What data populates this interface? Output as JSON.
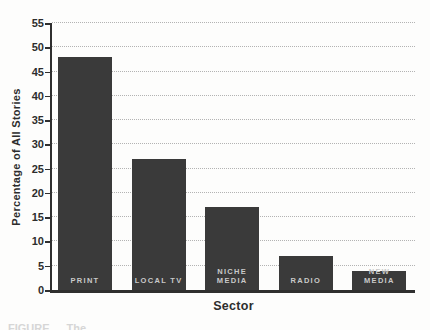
{
  "figure": {
    "caption_fragment": "FIGURE    The"
  },
  "chart_data": {
    "type": "bar",
    "title": "",
    "xlabel": "Sector",
    "ylabel": "Percentage of All Stories",
    "ylim": [
      0,
      55
    ],
    "ytick_step": 5,
    "yticks": [
      "0",
      "5",
      "10",
      "15",
      "20",
      "25",
      "30",
      "35",
      "40",
      "45",
      "50",
      "55"
    ],
    "grid": "horizontal-dotted",
    "legend_position": "none",
    "categories": [
      "PRINT",
      "LOCAL TV",
      "NICHE MEDIA",
      "RADIO",
      "NEW MEDIA"
    ],
    "values": [
      48,
      27,
      17,
      7,
      4
    ],
    "bars": [
      {
        "label": "PRINT",
        "label_lines": [
          "PRINT"
        ],
        "value": 48
      },
      {
        "label": "LOCAL TV",
        "label_lines": [
          "LOCAL TV"
        ],
        "value": 27
      },
      {
        "label": "NICHE MEDIA",
        "label_lines": [
          "NICHE",
          "MEDIA"
        ],
        "value": 17
      },
      {
        "label": "RADIO",
        "label_lines": [
          "RADIO"
        ],
        "value": 7
      },
      {
        "label": "NEW MEDIA",
        "label_lines": [
          "NEW",
          "MEDIA"
        ],
        "value": 4
      }
    ],
    "colors": {
      "bar": "#3a3a3a",
      "bar_label": "#c9c9c9",
      "axis": "#2f2f2f",
      "gridline": "#b3b3b3",
      "text": "#2d2d2d",
      "background": "#fdfdfc"
    }
  }
}
